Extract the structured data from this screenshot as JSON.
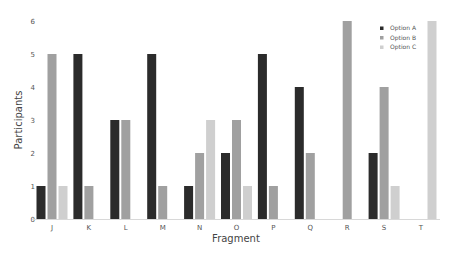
{
  "chart_data": {
    "type": "bar",
    "title": "",
    "xlabel": "Fragment",
    "ylabel": "Participants",
    "ylim": [
      0,
      6
    ],
    "yticks": [
      0,
      1,
      2,
      3,
      4,
      5,
      6
    ],
    "grid": false,
    "legend_position": "upper right",
    "categories": [
      "J",
      "K",
      "L",
      "M",
      "N",
      "O",
      "P",
      "Q",
      "R",
      "S",
      "T"
    ],
    "series": [
      {
        "name": "Option A",
        "color": "#2b2b2b",
        "values": [
          1,
          5,
          3,
          5,
          1,
          2,
          5,
          4,
          0,
          2,
          0
        ]
      },
      {
        "name": "Option B",
        "color": "#a0a0a0",
        "values": [
          5,
          1,
          3,
          1,
          2,
          3,
          1,
          2,
          6,
          4,
          0
        ]
      },
      {
        "name": "Option C",
        "color": "#cfcfcf",
        "values": [
          1,
          0,
          0,
          0,
          3,
          1,
          0,
          0,
          0,
          1,
          6
        ]
      }
    ]
  }
}
